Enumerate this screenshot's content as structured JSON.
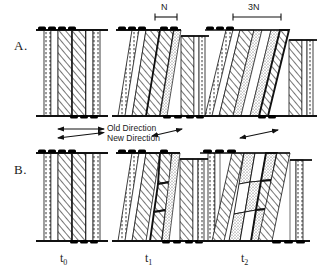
{
  "figure": {
    "panels": [
      {
        "id": "A",
        "label": "A."
      },
      {
        "id": "B",
        "label": "B."
      }
    ],
    "time_labels": [
      {
        "id": "t0",
        "base": "t",
        "sub": "0",
        "x": 62,
        "y": 258
      },
      {
        "id": "t1",
        "base": "t",
        "sub": "1",
        "x": 147,
        "y": 258
      },
      {
        "id": "t2",
        "base": "t",
        "sub": "2",
        "x": 243,
        "y": 258
      }
    ],
    "scale_bars": [
      {
        "id": "scale-n",
        "label": "N",
        "x": 155,
        "y": 14,
        "width": 22
      },
      {
        "id": "scale-3n",
        "label": "3N",
        "x": 233,
        "y": 14,
        "width": 48
      }
    ],
    "direction_arrows": [
      {
        "id": "old-direction",
        "label": "Old Direction"
      },
      {
        "id": "new-direction",
        "label": "New Direction"
      }
    ],
    "colors": {
      "ink": "#111111",
      "hatch": "#2b2b2b",
      "stipple": "#555555",
      "background": "#ffffff",
      "marker": "#000000"
    },
    "columns": [
      {
        "id": "A-t0",
        "panel": "A",
        "time": "t0",
        "shear_deg": 0,
        "segmented": false,
        "bands": [
          "stipple",
          "hatch",
          "hatch",
          "stipple"
        ]
      },
      {
        "id": "A-t1",
        "panel": "A",
        "time": "t1",
        "shear_deg": 9,
        "segmented": false,
        "bands": [
          "stipple",
          "hatch",
          "hatch",
          "stipple",
          "hatch",
          "stipple"
        ]
      },
      {
        "id": "A-t2",
        "panel": "A",
        "time": "t2",
        "shear_deg": 20,
        "segmented": false,
        "bands": [
          "stipple",
          "hatch",
          "stipple",
          "hatch",
          "stipple",
          "hatch",
          "stipple"
        ]
      },
      {
        "id": "B-t0",
        "panel": "B",
        "time": "t0",
        "shear_deg": 0,
        "segmented": false,
        "bands": [
          "stipple",
          "hatch",
          "hatch",
          "stipple"
        ]
      },
      {
        "id": "B-t1",
        "panel": "B",
        "time": "t1",
        "shear_deg": 9,
        "segmented": true,
        "segments": 3,
        "bands": [
          "stipple",
          "hatch",
          "hatch",
          "stipple",
          "hatch",
          "stipple"
        ]
      },
      {
        "id": "B-t2",
        "panel": "B",
        "time": "t2",
        "shear_deg": 20,
        "segmented": true,
        "segments": 3,
        "bands": [
          "stipple",
          "hatch",
          "stipple",
          "hatch",
          "stipple",
          "hatch",
          "stipple"
        ]
      }
    ]
  }
}
